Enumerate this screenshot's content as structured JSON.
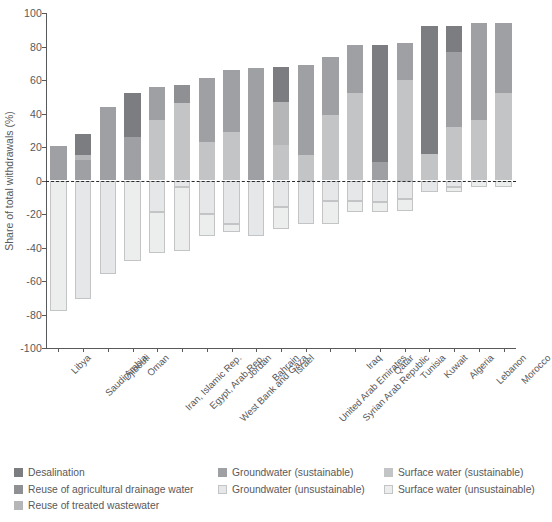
{
  "chart_data": {
    "type": "bar",
    "title": "",
    "subtitle": "",
    "xlabel": "",
    "ylabel": "Share of total withdrawals (%)",
    "ylim": [
      -100,
      100
    ],
    "yticks": [
      100,
      80,
      60,
      40,
      20,
      0,
      -20,
      -40,
      -60,
      -80,
      -100
    ],
    "ytick_labels": [
      "100",
      "80",
      "60",
      "40",
      "20",
      "0",
      "-20",
      "-40",
      "-60",
      "-80",
      "-100"
    ],
    "grid": false,
    "zero_reference_line": true,
    "stacked": true,
    "legend_position": "bottom",
    "categories": [
      "Libya",
      "Saudi Arabia",
      "Djibouti",
      "Oman",
      "Iran, Islamic Rep.",
      "Egypt, Arab Rep.",
      "West Bank and Gaza",
      "Jordan",
      "Bahrain",
      "Israel",
      "United Arab Emirates",
      "Syrian Arab Republic",
      "Iraq",
      "Qatar",
      "Tunisia",
      "Kuwait",
      "Algeria",
      "Lebanon",
      "Morocco",
      "Morocco"
    ],
    "series": [
      {
        "name": "Surface water (sustainable)",
        "color": "#c3c4c6",
        "values": [
          0,
          0,
          44,
          26,
          0,
          46,
          23,
          29,
          21,
          0,
          15,
          39,
          52,
          0,
          60,
          16,
          32,
          36,
          52,
          0
        ]
      },
      {
        "name": "Groundwater (sustainable)",
        "color": "#9fa0a3",
        "values": [
          20.5,
          12,
          0,
          0,
          36,
          0,
          0,
          0,
          0,
          0,
          0,
          0,
          0,
          0,
          0,
          0,
          0,
          0,
          0,
          0
        ]
      },
      {
        "name": "Reuse of treated wastewater",
        "color": "#b5b6b8",
        "values": [
          0,
          0,
          0,
          0,
          0,
          0,
          0,
          0,
          0,
          0,
          0,
          0,
          0,
          0,
          0,
          0,
          0,
          0,
          0,
          0
        ]
      },
      {
        "name": "Reuse of agricultural drainage water",
        "color": "#8e9093",
        "values": [
          0,
          0,
          0,
          0,
          0,
          0,
          0,
          0,
          0,
          0,
          0,
          0,
          0,
          0,
          0,
          0,
          0,
          0,
          0,
          0
        ]
      },
      {
        "name": "Desalination",
        "color": "#7b7d80",
        "values": [
          0,
          16,
          0,
          26,
          20,
          11,
          34,
          37,
          46,
          68,
          53,
          29,
          22,
          81,
          21,
          76,
          60,
          58,
          42,
          0
        ]
      }
    ],
    "bars": [
      {
        "country": "Libya",
        "positive": [
          {
            "type": "groundwater_sustainable",
            "value": 20.5
          }
        ],
        "negative": [
          {
            "type": "surface_water_unsustainable",
            "value": -78
          }
        ],
        "total_positive": 20.5,
        "total_negative": -78
      },
      {
        "country": "Saudi Arabia",
        "positive": [
          {
            "type": "groundwater_sustainable",
            "value": 12
          },
          {
            "type": "reuse_treated_wastewater",
            "value": 3
          },
          {
            "type": "desalination",
            "value": 13
          }
        ],
        "negative": [
          {
            "type": "groundwater_unsustainable",
            "value": -71
          }
        ],
        "total_positive": 28,
        "total_negative": -71
      },
      {
        "country": "Djibouti",
        "positive": [
          {
            "type": "groundwater_sustainable",
            "value": 44
          }
        ],
        "negative": [
          {
            "type": "groundwater_unsustainable",
            "value": -56
          }
        ],
        "total_positive": 44,
        "total_negative": -56
      },
      {
        "country": "Oman",
        "positive": [
          {
            "type": "groundwater_sustainable",
            "value": 26
          },
          {
            "type": "desalination",
            "value": 26
          }
        ],
        "negative": [
          {
            "type": "surface_water_unsustainable",
            "value": -48
          }
        ],
        "total_positive": 52,
        "total_negative": -48
      },
      {
        "country": "Iran, Islamic Rep.",
        "positive": [
          {
            "type": "surface_water_sustainable",
            "value": 36
          },
          {
            "type": "groundwater_sustainable",
            "value": 20
          }
        ],
        "negative": [
          {
            "type": "groundwater_unsustainable",
            "value": -19
          },
          {
            "type": "surface_water_unsustainable",
            "value": -24
          }
        ],
        "total_positive": 56,
        "total_negative": -43
      },
      {
        "country": "Egypt, Arab Rep.",
        "positive": [
          {
            "type": "surface_water_sustainable",
            "value": 46
          },
          {
            "type": "reuse_agricultural_drainage",
            "value": 11
          }
        ],
        "negative": [
          {
            "type": "groundwater_unsustainable",
            "value": -4
          },
          {
            "type": "surface_water_unsustainable",
            "value": -38
          }
        ],
        "total_positive": 57,
        "total_negative": -42
      },
      {
        "country": "West Bank and Gaza",
        "positive": [
          {
            "type": "surface_water_sustainable",
            "value": 23
          },
          {
            "type": "groundwater_sustainable",
            "value": 38
          }
        ],
        "negative": [
          {
            "type": "groundwater_unsustainable",
            "value": -20
          },
          {
            "type": "surface_water_unsustainable",
            "value": -13
          }
        ],
        "total_positive": 61,
        "total_negative": -33
      },
      {
        "country": "Jordan",
        "positive": [
          {
            "type": "surface_water_sustainable",
            "value": 29
          },
          {
            "type": "groundwater_sustainable",
            "value": 37
          }
        ],
        "negative": [
          {
            "type": "groundwater_unsustainable",
            "value": -26
          },
          {
            "type": "surface_water_unsustainable",
            "value": -5
          }
        ],
        "total_positive": 66,
        "total_negative": -31
      },
      {
        "country": "Bahrain",
        "positive": [
          {
            "type": "groundwater_sustainable",
            "value": 67
          }
        ],
        "negative": [
          {
            "type": "groundwater_unsustainable",
            "value": -33
          }
        ],
        "total_positive": 67,
        "total_negative": -33
      },
      {
        "country": "Israel",
        "positive": [
          {
            "type": "surface_water_sustainable",
            "value": 21
          },
          {
            "type": "reuse_treated_wastewater",
            "value": 26
          },
          {
            "type": "desalination",
            "value": 21
          }
        ],
        "negative": [
          {
            "type": "groundwater_unsustainable",
            "value": -16
          },
          {
            "type": "surface_water_unsustainable",
            "value": -13
          }
        ],
        "total_positive": 68,
        "total_negative": -29
      },
      {
        "country": "United Arab Emirates",
        "positive": [
          {
            "type": "surface_water_sustainable",
            "value": 15
          },
          {
            "type": "groundwater_sustainable",
            "value": 54
          }
        ],
        "negative": [
          {
            "type": "groundwater_unsustainable",
            "value": -26
          }
        ],
        "total_positive": 69,
        "total_negative": -26
      },
      {
        "country": "Syrian Arab Republic",
        "positive": [
          {
            "type": "surface_water_sustainable",
            "value": 39
          },
          {
            "type": "groundwater_sustainable",
            "value": 35
          }
        ],
        "negative": [
          {
            "type": "groundwater_unsustainable",
            "value": -12
          },
          {
            "type": "surface_water_unsustainable",
            "value": -14
          }
        ],
        "total_positive": 74,
        "total_negative": -26
      },
      {
        "country": "Iraq",
        "positive": [
          {
            "type": "surface_water_sustainable",
            "value": 52
          },
          {
            "type": "groundwater_sustainable",
            "value": 29
          }
        ],
        "negative": [
          {
            "type": "groundwater_unsustainable",
            "value": -12
          },
          {
            "type": "surface_water_unsustainable",
            "value": -7
          }
        ],
        "total_positive": 81,
        "total_negative": -19
      },
      {
        "country": "Qatar",
        "positive": [
          {
            "type": "groundwater_sustainable",
            "value": 11
          },
          {
            "type": "desalination",
            "value": 70
          }
        ],
        "negative": [
          {
            "type": "groundwater_unsustainable",
            "value": -13
          },
          {
            "type": "surface_water_unsustainable",
            "value": -6
          }
        ],
        "total_positive": 81,
        "total_negative": -19
      },
      {
        "country": "Tunisia",
        "positive": [
          {
            "type": "surface_water_sustainable",
            "value": 60
          },
          {
            "type": "groundwater_sustainable",
            "value": 22
          }
        ],
        "negative": [
          {
            "type": "groundwater_unsustainable",
            "value": -11
          },
          {
            "type": "surface_water_unsustainable",
            "value": -7
          }
        ],
        "total_positive": 82,
        "total_negative": -18
      },
      {
        "country": "Kuwait",
        "positive": [
          {
            "type": "surface_water_sustainable",
            "value": 16
          },
          {
            "type": "desalination",
            "value": 76
          }
        ],
        "negative": [
          {
            "type": "groundwater_unsustainable",
            "value": -7
          }
        ],
        "total_positive": 92,
        "total_negative": -7
      },
      {
        "country": "Algeria",
        "positive": [
          {
            "type": "surface_water_sustainable",
            "value": 32
          },
          {
            "type": "groundwater_sustainable",
            "value": 45
          },
          {
            "type": "desalination",
            "value": 15
          }
        ],
        "negative": [
          {
            "type": "groundwater_unsustainable",
            "value": -4
          },
          {
            "type": "surface_water_unsustainable",
            "value": -3
          }
        ],
        "total_positive": 92,
        "total_negative": -7
      },
      {
        "country": "Lebanon",
        "positive": [
          {
            "type": "surface_water_sustainable",
            "value": 36
          },
          {
            "type": "groundwater_sustainable",
            "value": 58
          }
        ],
        "negative": [
          {
            "type": "surface_water_unsustainable",
            "value": -4
          }
        ],
        "total_positive": 94,
        "total_negative": -4
      },
      {
        "country": "Morocco",
        "positive": [
          {
            "type": "surface_water_sustainable",
            "value": 52
          },
          {
            "type": "groundwater_sustainable",
            "value": 42
          }
        ],
        "negative": [
          {
            "type": "surface_water_unsustainable",
            "value": -4
          }
        ],
        "total_positive": 94,
        "total_negative": -4
      }
    ],
    "annotations": []
  },
  "legend": {
    "columns": [
      {
        "items": [
          {
            "label": "Desalination",
            "key": "desalination",
            "color": "#7b7d80",
            "outlined": false
          },
          {
            "label": "Reuse of agricultural drainage water",
            "key": "reuse_agricultural_drainage",
            "color": "#8e9093",
            "outlined": false
          },
          {
            "label": "Reuse of treated wastewater",
            "key": "reuse_treated_wastewater",
            "color": "#b5b6b8",
            "outlined": false
          }
        ]
      },
      {
        "items": [
          {
            "label": "Groundwater (sustainable)",
            "key": "groundwater_sustainable",
            "color": "#9fa0a3",
            "outlined": false
          },
          {
            "label": "Groundwater (unsustainable)",
            "key": "groundwater_unsustainable",
            "color": "#e6e7e8",
            "outlined": true
          }
        ]
      },
      {
        "items": [
          {
            "label": "Surface water (sustainable)",
            "key": "surface_water_sustainable",
            "color": "#c3c4c6",
            "outlined": false
          },
          {
            "label": "Surface water (unsustainable)",
            "key": "surface_water_unsustainable",
            "color": "#eceded",
            "outlined": true
          }
        ]
      }
    ]
  },
  "colors": {
    "desalination": "#7b7d80",
    "reuse_agricultural_drainage": "#8e9093",
    "reuse_treated_wastewater": "#b5b6b8",
    "groundwater_sustainable": "#9fa0a3",
    "groundwater_unsustainable": "#e6e7e8",
    "surface_water_sustainable": "#c3c4c6",
    "surface_water_unsustainable": "#eceded",
    "axis": "#58595b",
    "zero_line": "#2b2b2b",
    "outline": "#c3c4c6",
    "background": "#ffffff"
  }
}
